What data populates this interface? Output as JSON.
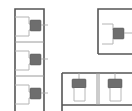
{
  "drawing": {
    "title": "Restroom floor plan",
    "type": "architectural-floor-plan",
    "background_color": "#ffffff",
    "colors": {
      "outer_wall": "#555555",
      "inner_wall": "#9a9a9a",
      "partition": "#b4b4b4",
      "fixture_tank": "#6e6e6e",
      "fixture_bowl": "#ffffff",
      "pipe": "#a8a8a8"
    },
    "canvas": {
      "width": 132,
      "height": 111
    }
  },
  "blocks": [
    {
      "id": "left-stall-column",
      "label": "",
      "x": 15,
      "y": 9,
      "width": 29,
      "height": 102,
      "orientation": "vertical",
      "stall_count": 3,
      "stalls": [
        {
          "id": "left-stall-1",
          "label": "",
          "divider_y": 42
        },
        {
          "id": "left-stall-2",
          "label": "",
          "divider_y": 76
        },
        {
          "id": "left-stall-3",
          "label": "",
          "divider_y": 111
        }
      ],
      "fixtures": [
        {
          "id": "wc-left-1",
          "label": "",
          "cx": 33,
          "cy": 26,
          "facing": "east"
        },
        {
          "id": "wc-left-2",
          "label": "",
          "cx": 33,
          "cy": 60,
          "facing": "east"
        },
        {
          "id": "wc-left-3",
          "label": "",
          "cx": 33,
          "cy": 94,
          "facing": "east"
        }
      ]
    },
    {
      "id": "upper-right-room",
      "label": "",
      "x": 98,
      "y": 9,
      "width": 34,
      "height": 45,
      "orientation": "vertical",
      "stall_count": 1,
      "stalls": [
        {
          "id": "right-stall-1",
          "label": "",
          "divider_y": 54
        }
      ],
      "fixtures": [
        {
          "id": "wc-right-1",
          "label": "",
          "cx": 117,
          "cy": 34,
          "facing": "east"
        }
      ]
    },
    {
      "id": "lower-right-row",
      "label": "",
      "x": 62,
      "y": 73,
      "width": 70,
      "height": 38,
      "orientation": "horizontal",
      "stall_count": 2,
      "stalls": [
        {
          "id": "bottom-stall-1",
          "label": "",
          "divider_x": 97
        },
        {
          "id": "bottom-stall-2",
          "label": "",
          "divider_x": 132
        }
      ],
      "fixtures": [
        {
          "id": "wc-bottom-1",
          "label": "",
          "cx": 79,
          "cy": 85,
          "facing": "south"
        },
        {
          "id": "wc-bottom-2",
          "label": "",
          "cx": 115,
          "cy": 85,
          "facing": "south"
        }
      ]
    }
  ]
}
